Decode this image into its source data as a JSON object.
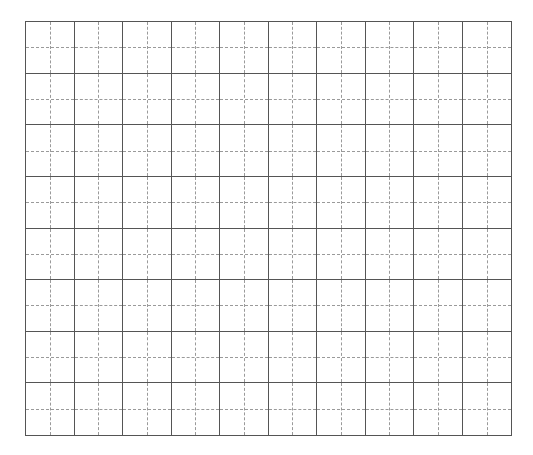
{
  "worksheet": {
    "type": "tianzige-writing-grid",
    "columns": 10,
    "rows": 8,
    "cells_text": [],
    "colors": {
      "background": "#ffffff",
      "solid_line": "#555555",
      "dashed_line": "#9a9a9a"
    }
  }
}
